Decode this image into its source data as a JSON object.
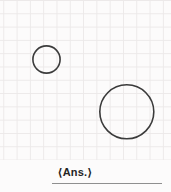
{
  "figure": {
    "caption": "⟨Ans.⟩"
  },
  "diagram": {
    "type": "geometry-grid",
    "grid": {
      "spacing_px": 13.3,
      "columns": 13,
      "rows": 12
    },
    "circles": [
      {
        "name": "small-circle",
        "cx": 46.5,
        "cy": 59.5,
        "r": 13.6
      },
      {
        "name": "large-circle",
        "cx": 126.8,
        "cy": 111.8,
        "r": 27
      }
    ]
  },
  "colors": {
    "background": "#fcfbfb",
    "grid_line": "#ece9e9",
    "circle_stroke": "#3b3b3b",
    "caption": "#242424",
    "underline": "#8f8f8f"
  }
}
